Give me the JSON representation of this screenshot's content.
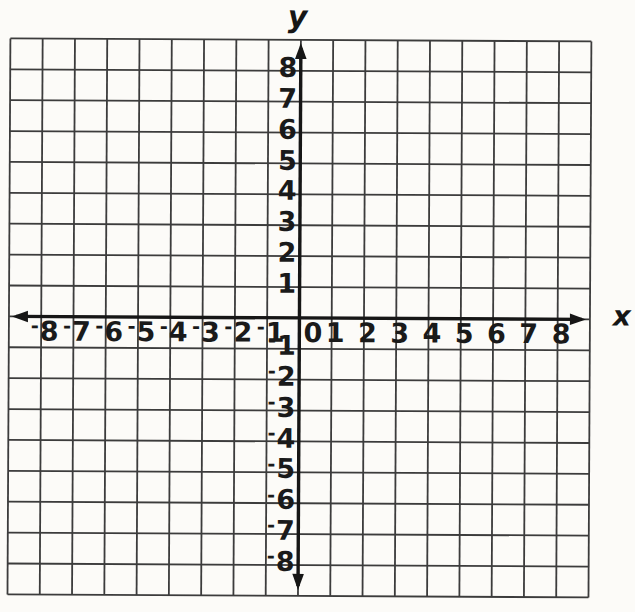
{
  "chart_data": {
    "type": "scatter",
    "title": "",
    "series": [],
    "xlabel": "x",
    "ylabel": "y",
    "xlim": [
      -9,
      9
    ],
    "ylim": [
      -9,
      9
    ],
    "x_ticks": [
      -8,
      -7,
      -6,
      -5,
      -4,
      -3,
      -2,
      -1,
      0,
      1,
      2,
      3,
      4,
      5,
      6,
      7,
      8
    ],
    "y_ticks": [
      8,
      7,
      6,
      5,
      4,
      3,
      2,
      1,
      -1,
      -2,
      -3,
      -4,
      -5,
      -6,
      -7,
      -8
    ],
    "origin_label": "0",
    "grid": true,
    "gridline_step": 1,
    "legend": false
  },
  "style": {
    "paper_color": "#fcfbf8",
    "grid_color": "#3c3c3c",
    "axis_color": "#161616",
    "label_color": "#1a1a1a"
  }
}
